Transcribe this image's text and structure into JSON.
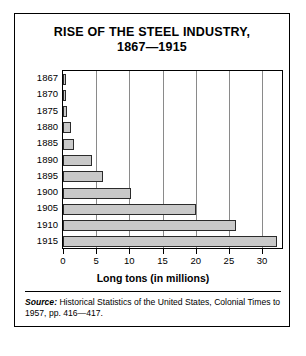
{
  "figure": {
    "title_line1": "RISE OF THE STEEL INDUSTRY,",
    "title_line2": "1867—1915",
    "source_label": "Source:",
    "source_text": " Historical Statistics of the United States, Colonial Times to 1957, pp. 416—417."
  },
  "chart_data": {
    "type": "bar",
    "orientation": "horizontal",
    "title": "RISE OF THE STEEL INDUSTRY, 1867—1915",
    "categories": [
      "1867",
      "1870",
      "1875",
      "1880",
      "1885",
      "1890",
      "1895",
      "1900",
      "1905",
      "1910",
      "1915"
    ],
    "values": [
      0.3,
      0.4,
      0.6,
      1.2,
      1.7,
      4.3,
      6.1,
      10.2,
      20.0,
      26.1,
      32.2
    ],
    "xlabel": "Long tons (in millions)",
    "ylabel": "",
    "xlim": [
      0,
      33
    ],
    "xticks": [
      0,
      5,
      10,
      15,
      20,
      25,
      30
    ],
    "xtick_labels": [
      "0",
      "5",
      "10",
      "15",
      "20",
      "25",
      "30"
    ],
    "grid": "vertical",
    "legend": "none",
    "bar_fill_color": "#c9c9c9",
    "bar_edge_color": "#2b2b2b"
  }
}
